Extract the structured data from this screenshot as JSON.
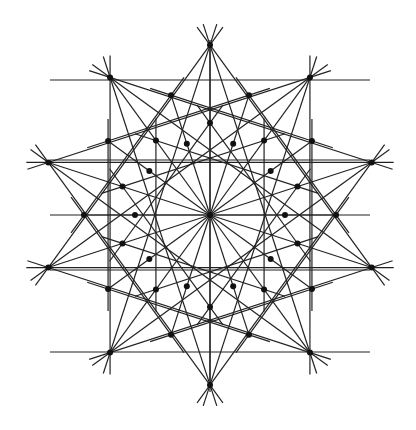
{
  "figure": {
    "width": 416,
    "height": 430,
    "center": [
      210,
      215
    ],
    "symmetry": 10,
    "line_color": "#222222",
    "node_color": "#111111",
    "rings": [
      {
        "name": "outer",
        "radius": 170,
        "offset_deg": 90
      },
      {
        "name": "second",
        "radius": 126,
        "offset_deg": 72
      },
      {
        "name": "third",
        "radius": 92,
        "offset_deg": 90
      },
      {
        "name": "fourth",
        "radius": 75,
        "offset_deg": 72
      }
    ],
    "chords": [
      {
        "ring": "outer",
        "step": 3
      },
      {
        "ring": "outer",
        "step": 4
      },
      {
        "ring": "second",
        "step": 2
      },
      {
        "ring": "third",
        "step": 3
      }
    ],
    "axes": {
      "horizontal_y": [
        80,
        160,
        215,
        270,
        352
      ],
      "vertical_x": [
        210
      ]
    },
    "spokes_from_center": 20
  }
}
